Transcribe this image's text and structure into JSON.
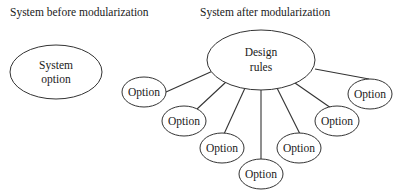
{
  "diagram": {
    "before": {
      "title": "System before modularization",
      "node": {
        "line1": "System",
        "line2": "option"
      }
    },
    "after": {
      "title": "System after modularization",
      "hub": {
        "line1": "Design",
        "line2": "rules"
      },
      "options": [
        {
          "label": "Option"
        },
        {
          "label": "Option"
        },
        {
          "label": "Option"
        },
        {
          "label": "Option"
        },
        {
          "label": "Option"
        },
        {
          "label": "Option"
        },
        {
          "label": "Option"
        }
      ]
    },
    "colors": {
      "stroke": "#333333",
      "text": "#1a1a1a",
      "background": "#ffffff"
    }
  }
}
